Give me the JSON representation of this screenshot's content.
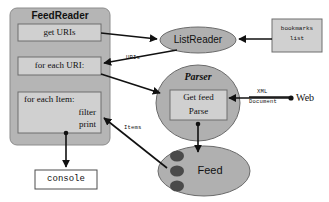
{
  "diagram": {
    "colors": {
      "container_fill": "#b5b5b5",
      "inner_box_fill": "#d0d0d0",
      "ellipse_fill": "#b0b0b0",
      "ellipse_stroke": "#6a6a6a",
      "box_stroke": "#6e6e6e",
      "white_fill": "#ffffff",
      "item_dot": "#4a4a4a",
      "arrow": "#111111",
      "background": "#ffffff"
    },
    "containers": [
      {
        "id": "feedreader",
        "label": "FeedReader",
        "shape": "rounded-rect",
        "fill": "#b5b5b5"
      }
    ],
    "nodes": [
      {
        "id": "get-uris",
        "label": "get URIs",
        "shape": "rect",
        "fill": "#d0d0d0",
        "font": "serif"
      },
      {
        "id": "for-each-uri",
        "label": "for each URI:",
        "shape": "rect",
        "fill": "#d0d0d0",
        "font": "serif"
      },
      {
        "id": "for-each-item",
        "label": "for each Item:",
        "line2": "filter",
        "line3": "print",
        "shape": "rect",
        "fill": "#d0d0d0",
        "font": "serif"
      },
      {
        "id": "console",
        "label": "console",
        "shape": "rect",
        "fill": "#ffffff",
        "font": "mono"
      },
      {
        "id": "listreader",
        "label": "ListReader",
        "shape": "ellipse",
        "fill": "#b0b0b0",
        "font": "sans"
      },
      {
        "id": "bookmarks-list",
        "label": "bookmarks",
        "line2": "list",
        "shape": "rect",
        "fill": "#d0d0d0",
        "font": "mono"
      },
      {
        "id": "parser",
        "label": "Parser",
        "shape": "ellipse",
        "fill": "#b0b0b0",
        "font": "serif-italic"
      },
      {
        "id": "get-feed-parse",
        "label": "Get feed",
        "line2": "Parse",
        "shape": "rect",
        "fill": "#d0d0d0",
        "font": "serif"
      },
      {
        "id": "feed",
        "label": "Feed",
        "shape": "ellipse",
        "fill": "#b0b0b0",
        "font": "sans"
      },
      {
        "id": "web",
        "label": "Web",
        "shape": "endpoint-dot",
        "font": "serif"
      }
    ],
    "edge_labels": [
      {
        "id": "uris-label",
        "text": "URIs"
      },
      {
        "id": "items-label",
        "text": "Items"
      },
      {
        "id": "xml-label",
        "text": "XML"
      },
      {
        "id": "document-label",
        "text": "Document"
      }
    ]
  }
}
